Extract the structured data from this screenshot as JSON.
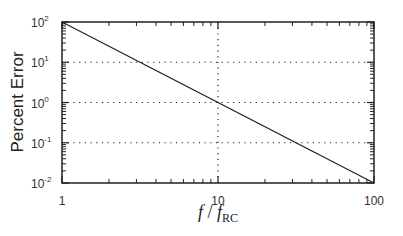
{
  "chart_data": {
    "type": "line",
    "title": "",
    "xlabel": "f / f_RC",
    "ylabel": "Percent Error",
    "xscale": "log",
    "yscale": "log",
    "xlim": [
      1,
      100
    ],
    "ylim": [
      0.01,
      100
    ],
    "x_ticks": [
      1,
      10,
      100
    ],
    "x_tick_labels": [
      "1",
      "10",
      "100"
    ],
    "y_ticks": [
      0.01,
      0.1,
      1,
      10,
      100
    ],
    "y_tick_labels": [
      "10^-2",
      "10^-1",
      "10^0",
      "10^1",
      "10^2"
    ],
    "grid": "dotted, at major ticks",
    "legend": null,
    "series": [
      {
        "name": "Percent Error",
        "color": "#222222",
        "x": [
          1,
          10,
          100
        ],
        "y": [
          100,
          1,
          0.01
        ]
      }
    ]
  },
  "labels": {
    "ylabel": "Percent Error",
    "xlabel_f": "f",
    "xlabel_sep": " / ",
    "xlabel_f2": "f",
    "xlabel_sub": "RC"
  },
  "colors": {
    "axis": "#222222",
    "line": "#222222",
    "grid": "#222222"
  }
}
